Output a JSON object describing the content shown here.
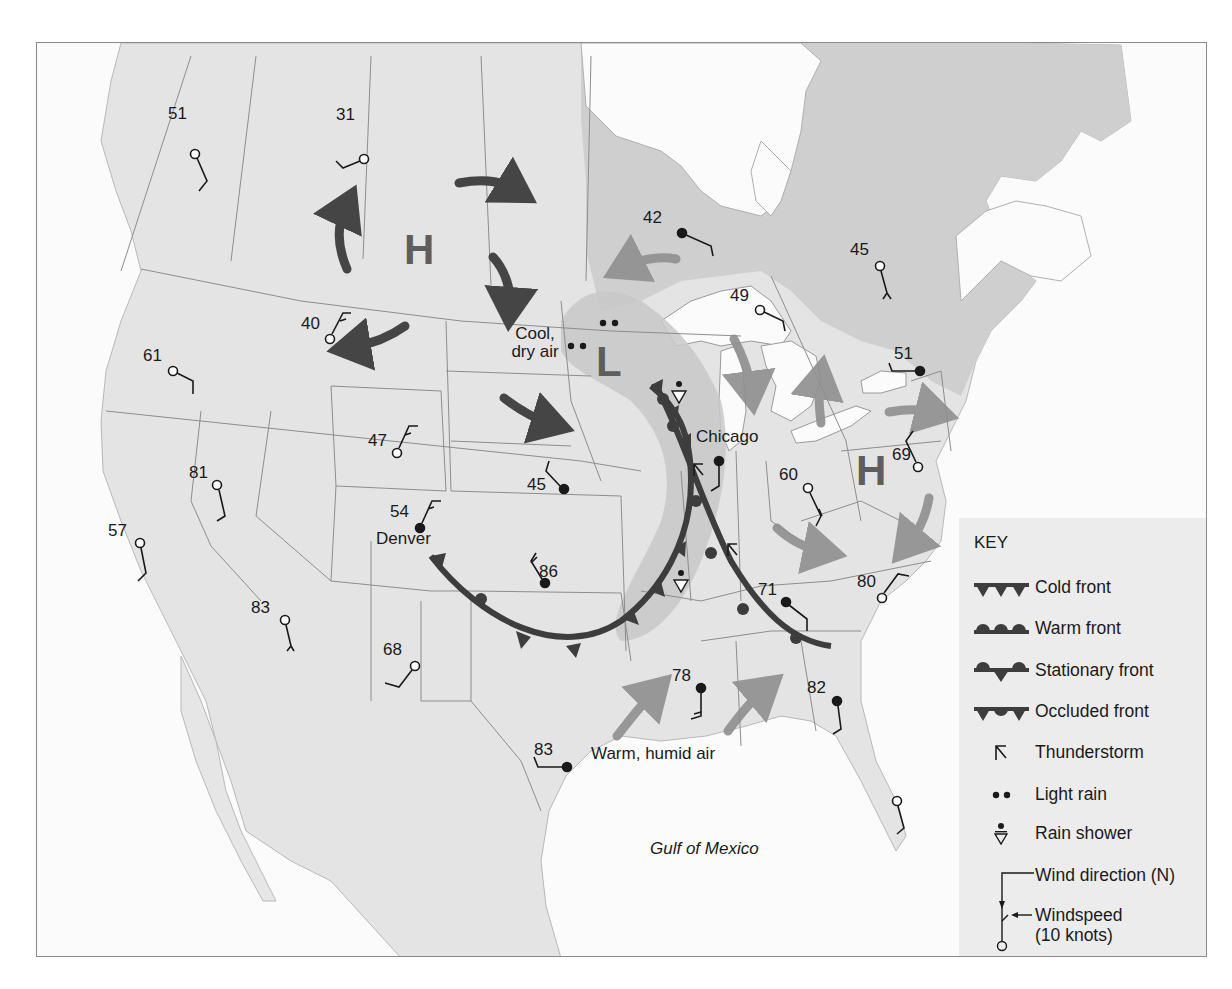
{
  "map": {
    "type": "weather-map",
    "region": "North America (United States and southern Canada)",
    "colors": {
      "ocean": "#fbfbfb",
      "land": "#e6e6e6",
      "canada_east": "#cfcfcf",
      "low_pressure_zone": "#c4c4c4",
      "front_line": "#3d3d3d",
      "cool_air_arrow": "#454545",
      "warm_air_arrow": "#8f8f8f",
      "pressure_letter": "#5e5e5e",
      "key_bg": "#ececec"
    }
  },
  "labels": {
    "cool_air": "Cool,\ndry air",
    "cool_air_line1": "Cool,",
    "cool_air_line2": "dry air",
    "warm_air": "Warm, humid air",
    "gulf": "Gulf of Mexico",
    "chicago": "Chicago",
    "denver": "Denver"
  },
  "pressure_systems": [
    {
      "symbol": "H",
      "type": "high",
      "location": "Alberta/Saskatchewan"
    },
    {
      "symbol": "L",
      "type": "low",
      "location": "Minnesota"
    },
    {
      "symbol": "H",
      "type": "high",
      "location": "Pennsylvania"
    }
  ],
  "stations": [
    {
      "temp": "51",
      "region": "British Columbia",
      "sky": "clear"
    },
    {
      "temp": "31",
      "region": "Alberta",
      "sky": "clear"
    },
    {
      "temp": "42",
      "region": "Northern Ontario",
      "sky": "overcast"
    },
    {
      "temp": "45",
      "region": "Quebec",
      "sky": "clear"
    },
    {
      "temp": "49",
      "region": "Ontario (Lake Superior)",
      "sky": "clear"
    },
    {
      "temp": "40",
      "region": "Montana",
      "sky": "clear"
    },
    {
      "temp": "61",
      "region": "Oregon",
      "sky": "clear"
    },
    {
      "temp": "51",
      "region": "New York",
      "sky": "overcast"
    },
    {
      "temp": "47",
      "region": "Wyoming",
      "sky": "clear"
    },
    {
      "temp": "69",
      "region": "Nevada",
      "sky": "clear"
    },
    {
      "temp": "45",
      "region": "Nebraska",
      "sky": "overcast"
    },
    {
      "temp": "60",
      "region": "Pennsylvania/New Jersey",
      "sky": "clear"
    },
    {
      "temp": "62",
      "region": "Ohio",
      "sky": "clear"
    },
    {
      "temp": "81",
      "region": "California",
      "sky": "clear"
    },
    {
      "temp": "57",
      "region": "Denver, Colorado",
      "sky": "overcast"
    },
    {
      "temp": "54",
      "region": "Kansas",
      "sky": "overcast"
    },
    {
      "temp": "86",
      "region": "Arizona",
      "sky": "clear"
    },
    {
      "temp": "83",
      "region": "New Mexico",
      "sky": "clear"
    },
    {
      "temp": "68",
      "region": "Tennessee",
      "sky": "overcast"
    },
    {
      "temp": "71",
      "region": "North Carolina",
      "sky": "clear"
    },
    {
      "temp": "80",
      "region": "Mississippi",
      "sky": "overcast"
    },
    {
      "temp": "78",
      "region": "Georgia",
      "sky": "overcast"
    },
    {
      "temp": "82",
      "region": "Texas",
      "sky": "overcast"
    },
    {
      "temp": "83",
      "region": "Florida",
      "sky": "clear"
    },
    {
      "temp": "",
      "region": "Chicago, Illinois",
      "sky": "overcast"
    }
  ],
  "key": {
    "title": "KEY",
    "items": [
      {
        "symbol": "cold-front",
        "label": "Cold front"
      },
      {
        "symbol": "warm-front",
        "label": "Warm front"
      },
      {
        "symbol": "stationary-front",
        "label": "Stationary front"
      },
      {
        "symbol": "occluded-front",
        "label": "Occluded front"
      },
      {
        "symbol": "thunderstorm",
        "label": "Thunderstorm"
      },
      {
        "symbol": "light-rain",
        "label": "Light rain"
      },
      {
        "symbol": "rain-shower",
        "label": "Rain shower"
      },
      {
        "symbol": "wind-direction",
        "label": "Wind direction (N)"
      },
      {
        "symbol": "windspeed",
        "label": "Windspeed"
      },
      {
        "symbol": "windspeed-note",
        "label": "(10 knots)"
      }
    ]
  }
}
